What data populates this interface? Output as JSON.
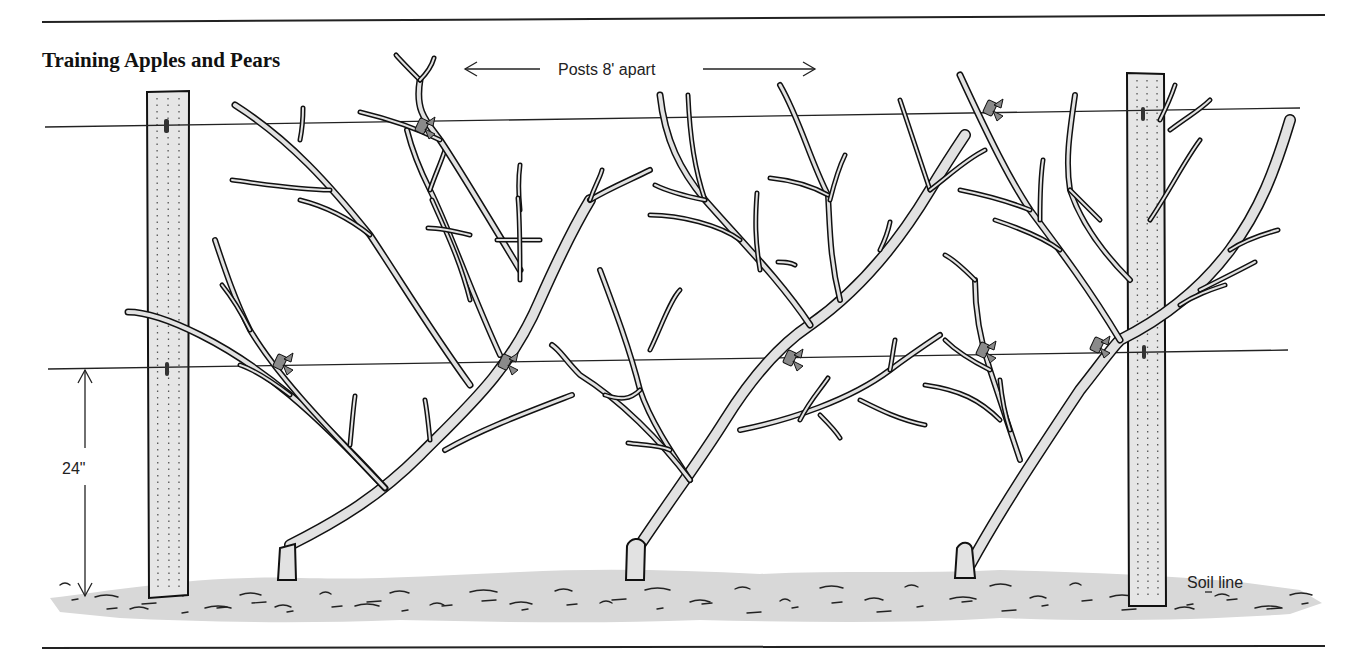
{
  "diagram": {
    "title": "Training Apples and Pears",
    "post_spacing_label": "Posts 8' apart",
    "wire_height_label": "24\"",
    "soil_label": "Soil line",
    "elements": {
      "posts": [
        "left-post",
        "right-post"
      ],
      "wires": [
        "upper-wire",
        "lower-wire"
      ],
      "trees": [
        "tree-left",
        "tree-middle",
        "tree-right"
      ],
      "tie_count": 7
    }
  }
}
